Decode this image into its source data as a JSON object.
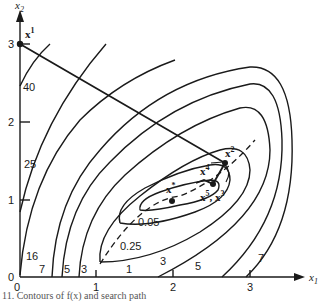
{
  "figure": {
    "axes": {
      "x_label": "x",
      "x_label_sub": "1",
      "y_label": "x",
      "y_label_sub": "2",
      "x_ticks": [
        "0",
        "1",
        "2",
        "3"
      ],
      "y_ticks": [
        "0",
        "1",
        "2",
        "3"
      ]
    },
    "contour_labels": [
      "40",
      "25",
      "16",
      "7",
      "5",
      "3",
      "1",
      "0.25",
      "0.05",
      "3",
      "5",
      "7"
    ],
    "points": {
      "x1": {
        "base": "x",
        "sup": "1"
      },
      "x2": {
        "base": "x",
        "sup": "2"
      },
      "x4": {
        "base": "x",
        "sup": "4"
      },
      "x53": {
        "base": "x",
        "sup": "5",
        "mid": ", x",
        "sup2": "3"
      },
      "xstar": {
        "base": "x",
        "sup": "*"
      }
    },
    "caption": "11.  Contours of f(x) and search path"
  }
}
